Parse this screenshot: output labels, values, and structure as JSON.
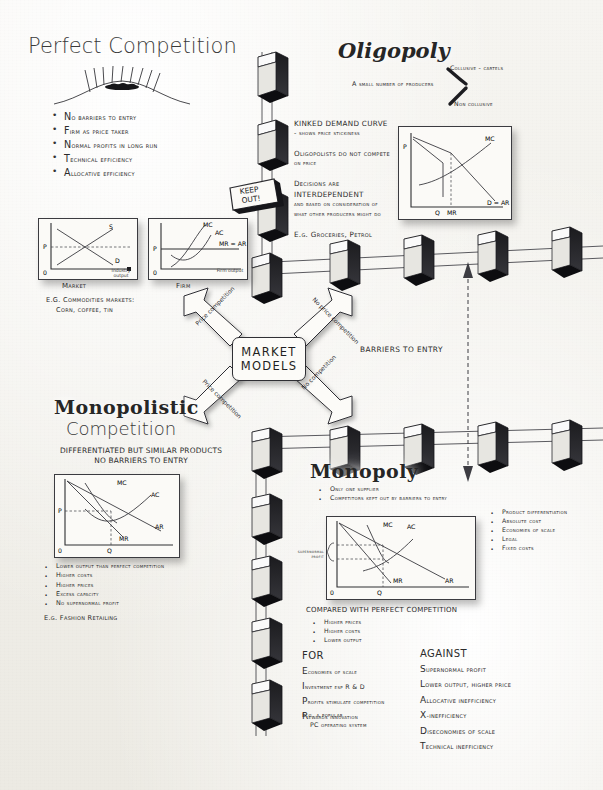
{
  "poster": {
    "title": "Market Models",
    "center_node": {
      "line1": "MARKET",
      "line2": "MODELS"
    },
    "arrows": [
      {
        "id": "arrow-top-left",
        "label": "Price competition"
      },
      {
        "id": "arrow-top-right",
        "label": "No price competition"
      },
      {
        "id": "arrow-bottom-left",
        "label": "Price competition"
      },
      {
        "id": "arrow-bottom-right",
        "label": "No competition"
      }
    ],
    "barriers_label": "BARRIERS TO ENTRY",
    "keep_out_sign": "KEEP OUT!"
  },
  "perfect_competition": {
    "heading": "Perfect Competition",
    "bullets": [
      "No barriers to entry",
      "Firm as price taker",
      "Normal profits in long run",
      "Technical efficiency",
      "Allocative efficiency"
    ],
    "chart_left": {
      "caption": "Market",
      "xlabel": "Industry output",
      "ylabel": "P",
      "curves": [
        "S",
        "D"
      ]
    },
    "chart_right": {
      "caption": "Firm",
      "xlabel": "Firm output",
      "ylabel": "P",
      "curves": [
        "MC",
        "AC",
        "MR = AR"
      ]
    },
    "example": {
      "line1": "E.G. Commodities markets:",
      "line2": "Corn, coffee, tin"
    }
  },
  "oligopoly": {
    "heading": "Oligopoly",
    "lead": "A small number of producers",
    "branches": [
      "Collusive - cartels",
      "Non collusive"
    ],
    "notes": [
      {
        "lines": [
          "KINKED DEMAND CURVE",
          "- shows price stickiness"
        ]
      },
      {
        "lines": [
          "Oligopolists do not compete",
          "on price"
        ]
      },
      {
        "lines": [
          "Decisions are INTERDEPENDENT",
          "and based on consideration of",
          "what other producers might do"
        ]
      },
      {
        "lines": [
          "E.g. Groceries, Petrol"
        ]
      }
    ],
    "chart": {
      "ylabel": "P",
      "xlabel": "Q",
      "curves": [
        "MC",
        "MR",
        "D = AR"
      ]
    }
  },
  "monopolistic_competition": {
    "heading_line1": "Monopolistic",
    "heading_line2": "Competition",
    "subheading": [
      "DIFFERENTIATED BUT SIMILAR PRODUCTS",
      "NO BARRIERS TO ENTRY"
    ],
    "chart": {
      "ylabel": "P",
      "xlabel": "Q",
      "curves": [
        "MC",
        "AC",
        "MR",
        "AR"
      ]
    },
    "bullets": [
      "Lower output than perfect competition",
      "Higher costs",
      "Higher prices",
      "Excess capacity",
      "No supernormal profit"
    ],
    "example": "E.g. Fashion Retailing"
  },
  "monopoly": {
    "heading": "Monopoly",
    "bullets": [
      "Only one supplier",
      "Competitors kept out by barriers to entry"
    ],
    "chart": {
      "ylabel": "P",
      "xlabel": "Q",
      "curves": [
        "MC",
        "AC",
        "MR",
        "AR"
      ],
      "annotation": "supernormal profit"
    },
    "barriers_list_title": "",
    "barriers_list": [
      "Product differentiation",
      "Absolute cost",
      "Economies of scale",
      "Legal",
      "Fixed costs"
    ],
    "compared_title": "COMPARED WITH PERFECT COMPETITION",
    "compared_bullets": [
      "Higher prices",
      "Higher costs",
      "Lower output"
    ],
    "for": {
      "title": "FOR",
      "items": [
        "Economies of scale",
        "Investment esp R & D",
        "Profits stimulate competition",
        "Rewards innovation"
      ],
      "example": [
        "E.g. a popular",
        "PC operating system"
      ]
    },
    "against": {
      "title": "AGAINST",
      "items": [
        "Supernormal profit",
        "Lower output, higher price",
        "Allocative inefficiency",
        "X-inefficiency",
        "Diseconomies of scale",
        "Technical inefficiency"
      ]
    }
  },
  "colors": {
    "paper": "#f2f1ec",
    "ink": "#35353a",
    "fence": "#1d1d20",
    "shadow": "rgba(0,0,0,0.26)"
  }
}
